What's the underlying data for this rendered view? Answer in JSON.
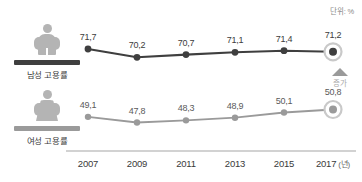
{
  "unit_note": "단위: %",
  "legend": {
    "male": {
      "label": "남성 고용률",
      "icon": "male-pictogram-icon"
    },
    "female": {
      "label": "여성 고용률",
      "icon": "female-pictogram-icon"
    }
  },
  "trend": {
    "icon": "up-triangle-icon",
    "label": "증가"
  },
  "xticks": [
    {
      "year": "2007",
      "unit": ""
    },
    {
      "year": "2009",
      "unit": ""
    },
    {
      "year": "2011",
      "unit": ""
    },
    {
      "year": "2013",
      "unit": ""
    },
    {
      "year": "2015",
      "unit": ""
    },
    {
      "year": "2017",
      "unit": "(년)"
    }
  ],
  "colors": {
    "male_line": "#3f3f3f",
    "female_line": "#9a9a9a",
    "axis": "#d2d2d2",
    "pictogram": "#b4b4b4",
    "highlight_ring": "#c9c9c9"
  },
  "chart_data": {
    "type": "line",
    "title": "",
    "subtitle": "",
    "xlabel": "(년)",
    "ylabel": "",
    "unit": "%",
    "grid": false,
    "legend_position": "left",
    "categories": [
      "2007",
      "2009",
      "2011",
      "2013",
      "2015",
      "2017"
    ],
    "series": [
      {
        "name": "남성 고용률",
        "color": "#3f3f3f",
        "values": [
          71.7,
          70.2,
          70.7,
          71.1,
          71.4,
          71.2
        ],
        "labels": [
          "71,7",
          "70,2",
          "70,7",
          "71,1",
          "71,4",
          "71,2"
        ],
        "highlight_last": true
      },
      {
        "name": "여성 고용률",
        "color": "#9a9a9a",
        "values": [
          49.1,
          47.8,
          48.3,
          48.9,
          50.1,
          50.8
        ],
        "labels": [
          "49,1",
          "47,8",
          "48,3",
          "48,9",
          "50,1",
          "50,8"
        ],
        "highlight_last": true
      }
    ],
    "annotations": [
      {
        "text": "단위: %",
        "position": "top-right"
      },
      {
        "text": "증가",
        "position": "right-middle",
        "icon": "up-triangle"
      }
    ]
  }
}
